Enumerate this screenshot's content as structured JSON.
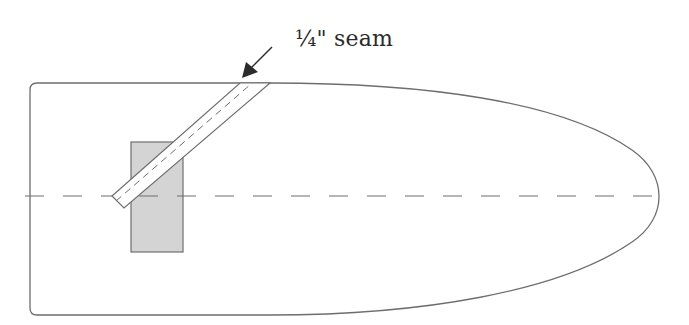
{
  "diagram": {
    "annotation": {
      "label": "¼\" seam",
      "arrow_direction": "down-left"
    },
    "shapes": {
      "outline": "rounded pattern piece with parabolic right end",
      "centerline": "dashed horizontal fold line",
      "patch": "gray rectangle",
      "strip": "diagonal strip with dashed stitch line"
    },
    "colors": {
      "stroke": "#6e6e6e",
      "patch_fill": "#d4d4d4",
      "text": "#2b2b2b",
      "background": "#ffffff"
    }
  }
}
